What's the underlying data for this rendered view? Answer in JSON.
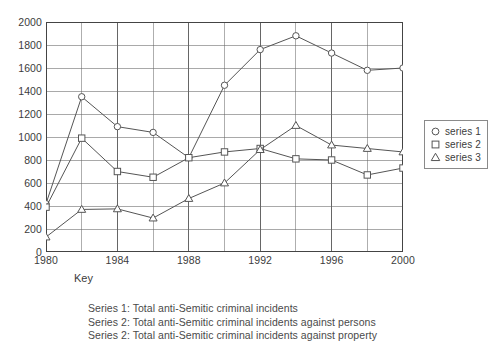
{
  "chart_data": {
    "type": "line",
    "title": "",
    "xlabel": "Key",
    "ylabel": "",
    "x": [
      1980,
      1982,
      1984,
      1986,
      1988,
      1990,
      1992,
      1994,
      1996,
      1998,
      2000
    ],
    "xlim": [
      1980,
      2000
    ],
    "ylim": [
      0,
      2000
    ],
    "grid": true,
    "legend_position": "right",
    "xticks": [
      "1980",
      "1984",
      "1988",
      "1992",
      "1996",
      "2000"
    ],
    "xtick_values": [
      1980,
      1984,
      1988,
      1992,
      1996,
      2000
    ],
    "yticks": [
      "0",
      "200",
      "400",
      "600",
      "800",
      "1000",
      "1200",
      "1400",
      "1600",
      "1800",
      "2000"
    ],
    "ytick_values": [
      0,
      200,
      400,
      600,
      800,
      1000,
      1200,
      1400,
      1600,
      1800,
      2000
    ],
    "series": [
      {
        "name": "series 1",
        "marker": "circle",
        "values": [
          420,
          1350,
          1090,
          1040,
          820,
          1450,
          1760,
          1880,
          1730,
          1580,
          1600
        ]
      },
      {
        "name": "series 2",
        "marker": "square",
        "values": [
          390,
          990,
          700,
          650,
          820,
          870,
          900,
          810,
          800,
          670,
          730
        ]
      },
      {
        "name": "series 3",
        "marker": "triangle",
        "values": [
          130,
          370,
          375,
          295,
          465,
          600,
          890,
          1100,
          930,
          900,
          870
        ]
      }
    ]
  },
  "legend": {
    "items": [
      {
        "label": "series 1",
        "marker": "circle"
      },
      {
        "label": "series 2",
        "marker": "square"
      },
      {
        "label": "series 3",
        "marker": "triangle"
      }
    ]
  },
  "axis": {
    "x_title": "Key"
  },
  "caption": {
    "lines": [
      "Series 1: Total anti-Semitic criminal incidents",
      "Series 2: Total anti-Semitic criminal incidents against persons",
      "Series 2: Total anti-Semitic criminal incidents against property"
    ]
  },
  "colors": {
    "line": "#555555",
    "grid": "#666666",
    "frame": "#444444",
    "text": "#3c3c3c",
    "background": "#ffffff"
  }
}
